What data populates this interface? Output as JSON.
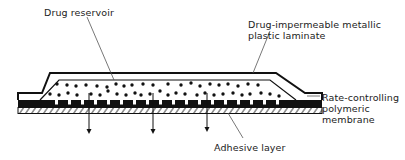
{
  "diagram": {
    "labels": {
      "drug_reservoir": "Drug reservoir",
      "laminate_line1": "Drug-impermeable metallic",
      "laminate_line2": "plastic laminate",
      "membrane_line1": "Rate-controlling",
      "membrane_line2": "polymeric",
      "membrane_line3": "membrane",
      "adhesive": "Adhesive layer"
    },
    "layers": [
      {
        "name": "Drug-impermeable metallic plastic laminate",
        "role": "backing"
      },
      {
        "name": "Drug reservoir",
        "role": "drug particles"
      },
      {
        "name": "Rate-controlling polymeric membrane",
        "role": "membrane"
      },
      {
        "name": "Adhesive layer",
        "role": "adhesive"
      }
    ],
    "release_arrows": 3,
    "colors": {
      "ink": "#111111",
      "background": "#ffffff"
    }
  }
}
